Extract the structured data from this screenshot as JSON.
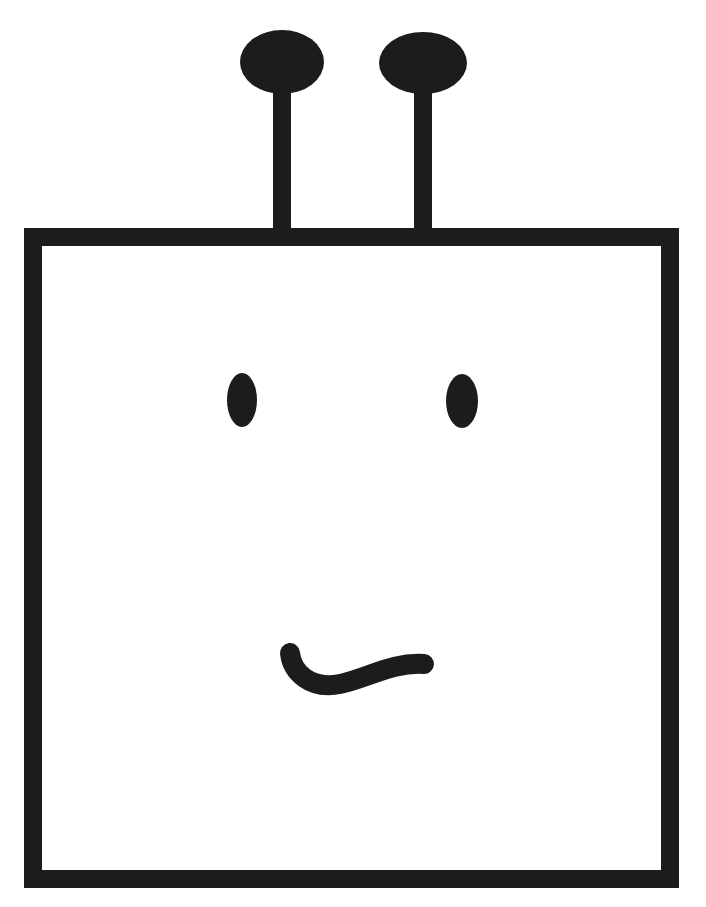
{
  "figure": {
    "colors": {
      "ink": "#1c1c1c",
      "background": "#ffffff"
    },
    "head": {
      "shape": "square",
      "x": 33,
      "y": 237,
      "width": 637,
      "height": 642,
      "stroke_width": 18
    },
    "antennae": [
      {
        "label": "left-antenna",
        "bulb": {
          "cx": 282,
          "cy": 62,
          "rx": 42,
          "ry": 32
        },
        "stem": {
          "x": 273,
          "y": 88,
          "width": 18,
          "height": 145
        }
      },
      {
        "label": "right-antenna",
        "bulb": {
          "cx": 423,
          "cy": 63,
          "rx": 44,
          "ry": 31
        },
        "stem": {
          "x": 414,
          "y": 90,
          "width": 18,
          "height": 143
        }
      }
    ],
    "eyes": [
      {
        "label": "left-eye",
        "cx": 242,
        "cy": 400,
        "rx": 15,
        "ry": 27
      },
      {
        "label": "right-eye",
        "cx": 462,
        "cy": 401,
        "rx": 16,
        "ry": 27
      }
    ],
    "mouth": {
      "label": "wavy-mouth",
      "path": "M 290 653 C 292 672, 310 690, 340 684 C 368 678, 392 662, 424 664",
      "stroke_width": 20
    }
  }
}
